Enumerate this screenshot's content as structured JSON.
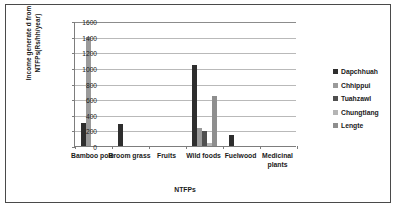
{
  "chart_data": {
    "type": "bar",
    "title": "",
    "xlabel": "NTFPs",
    "ylabel": "Income generate d from NTFPs(Rs/hh/year)",
    "ylim": [
      0,
      1600
    ],
    "ytick_step": 200,
    "yticks": [
      "1600",
      "1400",
      "1200",
      "1000",
      "800",
      "600",
      "400",
      "200",
      "0"
    ],
    "grid": true,
    "legend_position": "right",
    "categories": [
      "Bamboo pole",
      "Broom grass",
      "Fruits",
      "Wild foods",
      "Fuelwood",
      "Medicinal plants"
    ],
    "series": [
      {
        "name": "Dapchhuah",
        "color": "#2e2e2e",
        "values": [
          300,
          280,
          0,
          1040,
          145,
          0
        ]
      },
      {
        "name": "Chhippui",
        "color": "#9a9a9a",
        "values": [
          1400,
          0,
          0,
          235,
          0,
          0
        ]
      },
      {
        "name": "Tuahzawl",
        "color": "#4f4f4f",
        "values": [
          0,
          0,
          0,
          195,
          0,
          0
        ]
      },
      {
        "name": "Chungtlang",
        "color": "#b5b5b5",
        "values": [
          0,
          0,
          0,
          40,
          0,
          0
        ]
      },
      {
        "name": "Lengte",
        "color": "#8e8e8e",
        "values": [
          0,
          0,
          0,
          640,
          0,
          0
        ]
      }
    ]
  }
}
